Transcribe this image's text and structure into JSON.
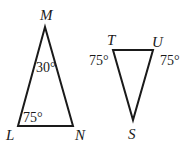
{
  "triangles": [
    {
      "name": "LMN",
      "vertices": {
        "M": "M",
        "L": "L",
        "N": "N"
      },
      "angles": {
        "M": "30°",
        "L": "75°"
      }
    },
    {
      "name": "TUS",
      "vertices": {
        "T": "T",
        "U": "U",
        "S": "S"
      },
      "angles": {
        "T": "75°",
        "U": "75°"
      }
    }
  ]
}
